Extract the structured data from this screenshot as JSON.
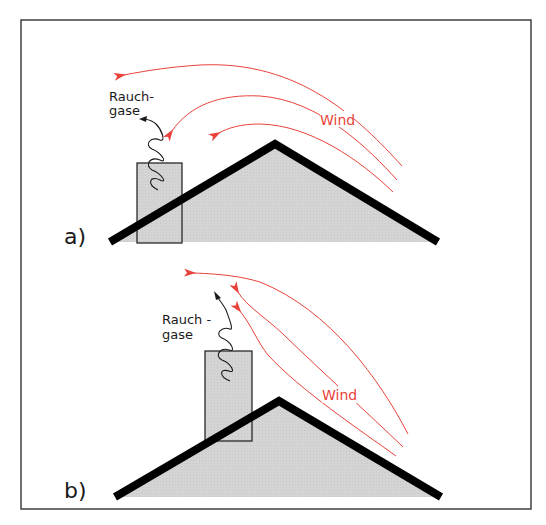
{
  "figure": {
    "frame_color": "#333333",
    "roof_fill": "#d2d2d2",
    "roof_stroke": "#000000",
    "chimney_fill": "#d2d2d2",
    "wind_color": "#e8423a",
    "smoke_color": "#1a1a1a"
  },
  "panels": [
    {
      "id": "a",
      "label": "a)",
      "smoke_label_line1": "Rauch-",
      "smoke_label_line2": "gase",
      "wind_label": "Wind",
      "description": "Short chimney below roof ridge: wind flowing over roof curls down into chimney, pushing flue gases back down"
    },
    {
      "id": "b",
      "label": "b)",
      "smoke_label_line1": "Rauch -",
      "smoke_label_line2": "gase",
      "wind_label": "Wind",
      "description": "Tall chimney above roof ridge: wind flows upward past chimney, flue gases escape upward"
    }
  ]
}
